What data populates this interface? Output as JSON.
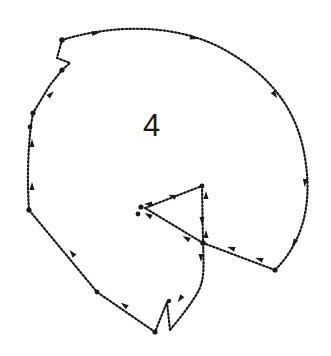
{
  "figure": {
    "label": "4",
    "colors": {
      "ink": "#1a1a1a",
      "background": "#ffffff"
    }
  }
}
